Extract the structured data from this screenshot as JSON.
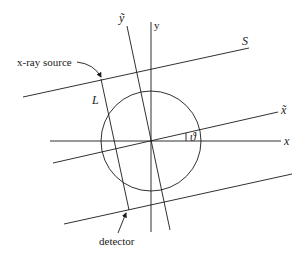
{
  "diagram": {
    "title": "",
    "labels": {
      "x_axis": "x",
      "y_axis": "y",
      "x_tilde": "x̃",
      "y_tilde": "ỹ",
      "source_line": "S",
      "ray_line": "L",
      "angle": "ϑ",
      "xray_source": "x-ray source",
      "detector": "detector"
    },
    "colors": {
      "stroke": "#1a1a1a",
      "background": "#ffffff"
    }
  }
}
